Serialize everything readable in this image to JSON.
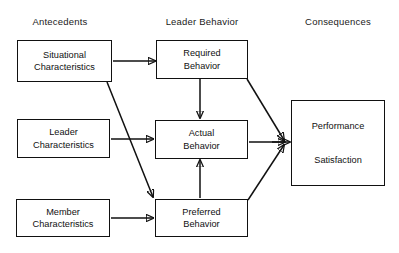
{
  "diagram": {
    "type": "flowchart",
    "stroke_color": "#111111",
    "background_color": "#ffffff",
    "columns": [
      {
        "id": "antecedents",
        "label": "Antecedents",
        "center_x": 180
      },
      {
        "id": "leader-behavior",
        "label": "Leader Behavior",
        "center_x": 604
      },
      {
        "id": "consequences",
        "label": "Consequences",
        "center_x": 1015
      }
    ],
    "nodes": [
      {
        "id": "situational-characteristics",
        "column": "antecedents",
        "line1": "Situational",
        "line2": "Characteristics"
      },
      {
        "id": "leader-characteristics",
        "column": "antecedents",
        "line1": "Leader",
        "line2": "Characteristics"
      },
      {
        "id": "member-characteristics",
        "column": "antecedents",
        "line1": "Member",
        "line2": "Characteristics"
      },
      {
        "id": "required-behavior",
        "column": "leader-behavior",
        "line1": "Required",
        "line2": "Behavior"
      },
      {
        "id": "actual-behavior",
        "column": "leader-behavior",
        "line1": "Actual",
        "line2": "Behavior"
      },
      {
        "id": "preferred-behavior",
        "column": "leader-behavior",
        "line1": "Preferred",
        "line2": "Behavior"
      },
      {
        "id": "outcomes",
        "column": "consequences",
        "line1": "Performance",
        "line2": "Satisfaction"
      }
    ],
    "edges": [
      {
        "id": "situational-to-required",
        "from": "situational-characteristics",
        "to": "required-behavior",
        "style": "horizontal-arrow"
      },
      {
        "id": "situational-to-preferred",
        "from": "situational-characteristics",
        "to": "preferred-behavior",
        "style": "diagonal-arrow"
      },
      {
        "id": "leader-to-actual",
        "from": "leader-characteristics",
        "to": "actual-behavior",
        "style": "horizontal-arrow"
      },
      {
        "id": "member-to-preferred",
        "from": "member-characteristics",
        "to": "preferred-behavior",
        "style": "horizontal-arrow"
      },
      {
        "id": "required-to-actual",
        "from": "required-behavior",
        "to": "actual-behavior",
        "style": "vertical-arrow"
      },
      {
        "id": "preferred-to-actual",
        "from": "preferred-behavior",
        "to": "actual-behavior",
        "style": "vertical-arrow"
      },
      {
        "id": "required-to-outcomes",
        "from": "required-behavior",
        "to": "outcomes",
        "style": "converging-arrow"
      },
      {
        "id": "actual-to-outcomes",
        "from": "actual-behavior",
        "to": "outcomes",
        "style": "converging-arrow"
      },
      {
        "id": "preferred-to-outcomes",
        "from": "preferred-behavior",
        "to": "outcomes",
        "style": "converging-arrow"
      },
      {
        "id": "junction-to-outcomes",
        "from": "junction",
        "to": "outcomes",
        "style": "horizontal-arrow"
      }
    ]
  }
}
